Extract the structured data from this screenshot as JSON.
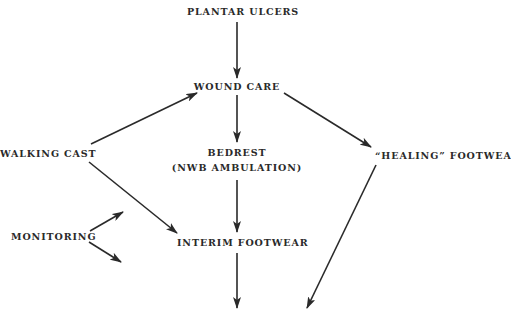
{
  "diagram": {
    "title": "",
    "nodes": {
      "plantar_ulcers": "PLANTAR ULCERS",
      "wound_care": "WOUND CARE",
      "walking_cast": "WALKING CAST",
      "bedrest_line1": "BEDREST",
      "bedrest_line2": "(NWB AMBULATION)",
      "healing_footwear": "“HEALING” FOOTWEAR",
      "monitoring": "MONITORING",
      "interim_footwear": "INTERIM FOOTWEAR"
    },
    "edges": [
      {
        "from": "PLANTAR ULCERS",
        "to": "WOUND CARE"
      },
      {
        "from": "WALKING CAST",
        "to": "WOUND CARE"
      },
      {
        "from": "WOUND CARE",
        "to": "BEDREST (NWB AMBULATION)"
      },
      {
        "from": "WOUND CARE",
        "to": "“HEALING” FOOTWEAR"
      },
      {
        "from": "BEDREST (NWB AMBULATION)",
        "to": "INTERIM FOOTWEAR"
      },
      {
        "from": "WALKING CAST",
        "to": "INTERIM FOOTWEAR"
      },
      {
        "from": "MONITORING",
        "to": "(up-right, open)"
      },
      {
        "from": "MONITORING",
        "to": "(down-right, open)"
      },
      {
        "from": "INTERIM FOOTWEAR",
        "to": "(down, open)"
      },
      {
        "from": "“HEALING” FOOTWEAR",
        "to": "(down-left, open)"
      }
    ],
    "colors": {
      "background": "#ffffff",
      "ink": "#2a2a2a"
    }
  }
}
